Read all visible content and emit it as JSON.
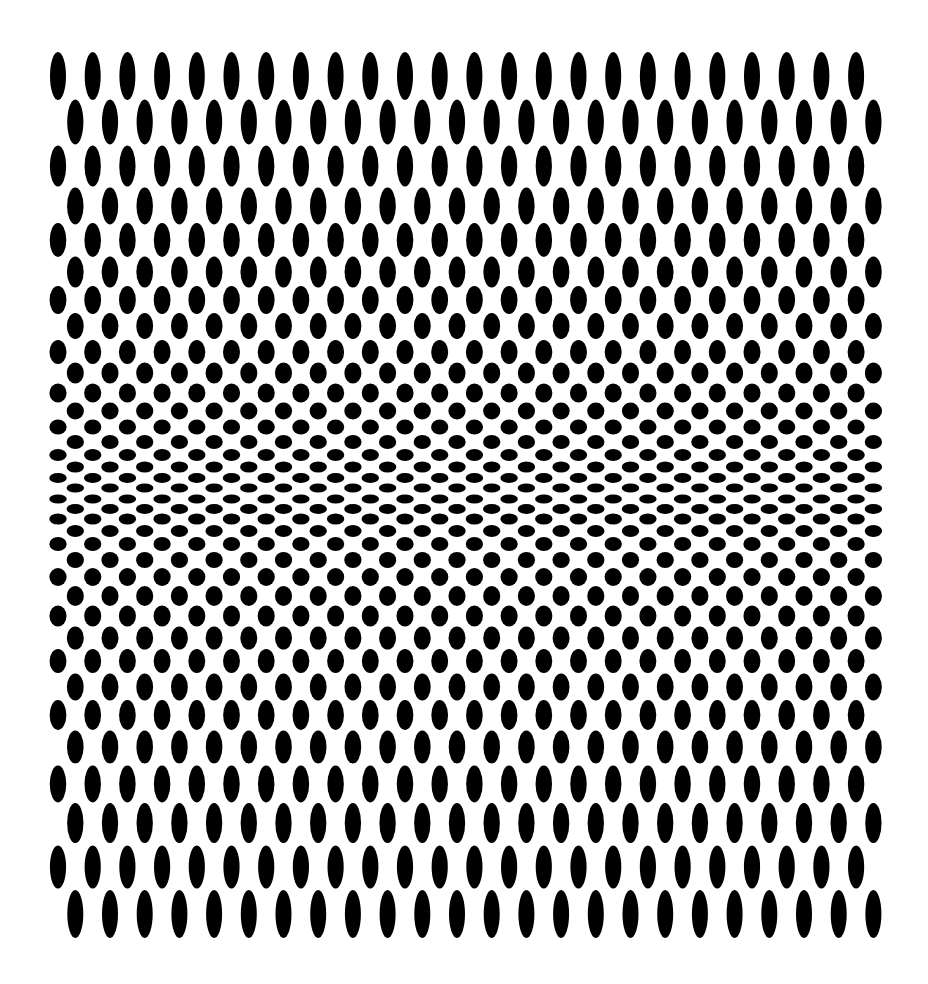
{
  "artwork": {
    "description": "Op-art pattern of black ellipses on white; alternating staggered rows compress toward the horizontal middle, where ellipses flatten",
    "background_color": "#ffffff",
    "ellipse_color": "#000000",
    "columns_per_row": 24,
    "column_spacing": 34.7,
    "left_row_first_x": 58,
    "offset_row_first_x": 75.3,
    "rows": [
      {
        "type": "L",
        "y": 76,
        "h": 48
      },
      {
        "type": "O",
        "y": 122,
        "h": 45
      },
      {
        "type": "L",
        "y": 166,
        "h": 41
      },
      {
        "type": "O",
        "y": 206,
        "h": 37
      },
      {
        "type": "L",
        "y": 240,
        "h": 34
      },
      {
        "type": "O",
        "y": 272,
        "h": 31
      },
      {
        "type": "L",
        "y": 300,
        "h": 28
      },
      {
        "type": "O",
        "y": 326,
        "h": 26
      },
      {
        "type": "L",
        "y": 352,
        "h": 24
      },
      {
        "type": "O",
        "y": 373,
        "h": 21
      },
      {
        "type": "L",
        "y": 393,
        "h": 19
      },
      {
        "type": "O",
        "y": 411,
        "h": 17
      },
      {
        "type": "L",
        "y": 427,
        "h": 15
      },
      {
        "type": "O",
        "y": 442,
        "h": 14
      },
      {
        "type": "L",
        "y": 455,
        "h": 12
      },
      {
        "type": "O",
        "y": 467,
        "h": 11
      },
      {
        "type": "L",
        "y": 478,
        "h": 10
      },
      {
        "type": "O",
        "y": 488,
        "h": 9
      },
      {
        "type": "L",
        "y": 499,
        "h": 9
      },
      {
        "type": "O",
        "y": 509,
        "h": 10
      },
      {
        "type": "L",
        "y": 519,
        "h": 11
      },
      {
        "type": "O",
        "y": 531,
        "h": 12
      },
      {
        "type": "L",
        "y": 544,
        "h": 14
      },
      {
        "type": "O",
        "y": 560,
        "h": 16
      },
      {
        "type": "L",
        "y": 577,
        "h": 18
      },
      {
        "type": "O",
        "y": 596,
        "h": 20
      },
      {
        "type": "L",
        "y": 616,
        "h": 21
      },
      {
        "type": "O",
        "y": 638,
        "h": 23
      },
      {
        "type": "L",
        "y": 661,
        "h": 24
      },
      {
        "type": "O",
        "y": 687,
        "h": 27
      },
      {
        "type": "L",
        "y": 715,
        "h": 30
      },
      {
        "type": "O",
        "y": 747,
        "h": 33
      },
      {
        "type": "L",
        "y": 784,
        "h": 37
      },
      {
        "type": "O",
        "y": 823,
        "h": 40
      },
      {
        "type": "L",
        "y": 867,
        "h": 43
      },
      {
        "type": "O",
        "y": 914,
        "h": 48
      }
    ],
    "faint_lines_y": [
      170
    ]
  }
}
